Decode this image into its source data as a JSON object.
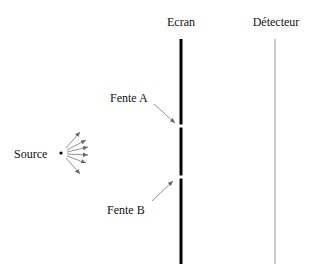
{
  "labels": {
    "screen": "Ecran",
    "detector": "Détecteur",
    "slit_a": "Fente A",
    "slit_b": "Fente B",
    "source": "Source"
  },
  "colors": {
    "screen": "#000000",
    "detector": "#888888",
    "arrows": "#777777",
    "text": "#111111"
  }
}
